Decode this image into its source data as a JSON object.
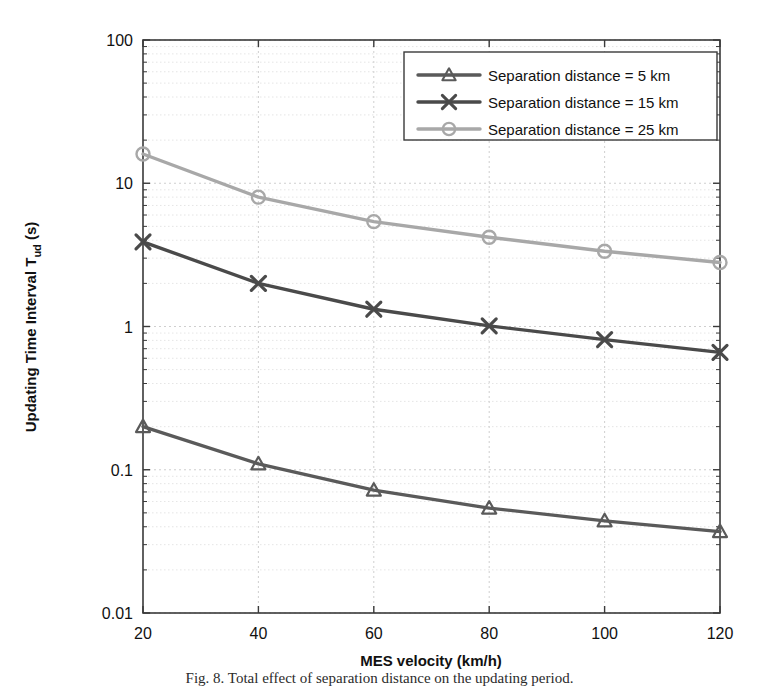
{
  "figure": {
    "caption": "Fig. 8.  Total effect of separation distance on the updating period."
  },
  "axes": {
    "x": {
      "label": "MES velocity (km/h)",
      "ticks": [
        "20",
        "40",
        "60",
        "80",
        "100",
        "120"
      ],
      "min": 20,
      "max": 120,
      "scale": "linear"
    },
    "y": {
      "label_main": "Updating Time Interval  T",
      "label_sub": "ud",
      "label_unit": " (s)",
      "ticks": [
        "0.01",
        "0.1",
        "1",
        "10",
        "100"
      ],
      "min": 0.01,
      "max": 100,
      "scale": "log"
    }
  },
  "legend": {
    "position": "top-right",
    "entries": [
      {
        "label": "Separation distance = 5 km",
        "marker": "triangle-marker",
        "color": "#5a5a5a"
      },
      {
        "label": "Separation distance = 15 km",
        "marker": "cross-marker",
        "color": "#4a4a4a"
      },
      {
        "label": "Separation distance = 25 km",
        "marker": "circle-marker",
        "color": "#a8a8a8"
      }
    ]
  },
  "colors": {
    "series_5km": "#5a5a5a",
    "series_15km": "#4a4a4a",
    "series_25km": "#a8a8a8",
    "axis": "#3a3a3a",
    "grid_major": "#c9c9c9",
    "grid_minor": "#dedede",
    "background": "#ffffff"
  },
  "chart_data": {
    "type": "line",
    "title": "",
    "xlabel": "MES velocity (km/h)",
    "ylabel": "Updating Time Interval T_ud (s)",
    "xlim": [
      20,
      120
    ],
    "ylim": [
      0.01,
      100
    ],
    "yscale": "log",
    "xscale": "linear",
    "grid": true,
    "legend_position": "top-right",
    "x": [
      20,
      40,
      60,
      80,
      100,
      120
    ],
    "series": [
      {
        "name": "Separation distance = 5 km",
        "marker": "triangle",
        "color": "#5a5a5a",
        "values": [
          0.2,
          0.11,
          0.072,
          0.054,
          0.044,
          0.037
        ]
      },
      {
        "name": "Separation distance = 15 km",
        "marker": "x",
        "color": "#4a4a4a",
        "values": [
          3.9,
          2.0,
          1.32,
          1.01,
          0.81,
          0.66
        ]
      },
      {
        "name": "Separation distance = 25 km",
        "marker": "circle",
        "color": "#a8a8a8",
        "values": [
          16.0,
          8.0,
          5.4,
          4.2,
          3.35,
          2.8
        ]
      }
    ]
  }
}
